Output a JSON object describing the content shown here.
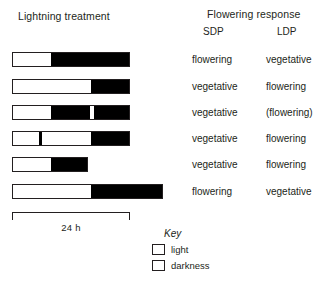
{
  "headings": {
    "left_title": "Lightning treatment",
    "right_title": "Flowering response",
    "col_sdp": "SDP",
    "col_ldp": "LDP"
  },
  "scale": {
    "label": "24 h",
    "start_px": 12,
    "end_px": 130,
    "hours": 24
  },
  "key": {
    "title": "Key",
    "items": [
      {
        "swatch": "light",
        "label": "light",
        "color": "#ffffff"
      },
      {
        "swatch": "darkness",
        "label": "darkness",
        "color": "#000000"
      }
    ]
  },
  "rows": [
    {
      "id": "row-1",
      "top": 52,
      "left": 12,
      "width": 118,
      "segments": [
        {
          "type": "light",
          "start": 0,
          "width": 38
        },
        {
          "type": "dark",
          "start": 38,
          "width": 80
        }
      ],
      "sdp": "flowering",
      "ldp": "vegetative"
    },
    {
      "id": "row-2",
      "top": 79,
      "left": 12,
      "width": 118,
      "segments": [
        {
          "type": "light",
          "start": 0,
          "width": 78
        },
        {
          "type": "dark",
          "start": 78,
          "width": 40
        }
      ],
      "sdp": "vegetative",
      "ldp": "flowering"
    },
    {
      "id": "row-3",
      "top": 105,
      "left": 12,
      "width": 118,
      "segments": [
        {
          "type": "light",
          "start": 0,
          "width": 38
        },
        {
          "type": "dark",
          "start": 38,
          "width": 39
        },
        {
          "type": "light",
          "start": 77,
          "width": 4
        },
        {
          "type": "dark",
          "start": 81,
          "width": 37
        }
      ],
      "sdp": "vegetative",
      "ldp": "(flowering)"
    },
    {
      "id": "row-4",
      "top": 131,
      "left": 12,
      "width": 118,
      "segments": [
        {
          "type": "light",
          "start": 0,
          "width": 26
        },
        {
          "type": "dark",
          "start": 26,
          "width": 3
        },
        {
          "type": "light",
          "start": 29,
          "width": 49
        },
        {
          "type": "dark",
          "start": 78,
          "width": 40
        }
      ],
      "sdp": "vegetative",
      "ldp": "flowering"
    },
    {
      "id": "row-5",
      "top": 157,
      "left": 12,
      "width": 76,
      "segments": [
        {
          "type": "light",
          "start": 0,
          "width": 38
        },
        {
          "type": "dark",
          "start": 38,
          "width": 38
        }
      ],
      "sdp": "vegetative",
      "ldp": "flowering"
    },
    {
      "id": "row-6",
      "top": 184,
      "left": 12,
      "width": 151,
      "segments": [
        {
          "type": "light",
          "start": 0,
          "width": 78
        },
        {
          "type": "dark",
          "start": 78,
          "width": 73
        }
      ],
      "sdp": "flowering",
      "ldp": "vegetative"
    }
  ]
}
